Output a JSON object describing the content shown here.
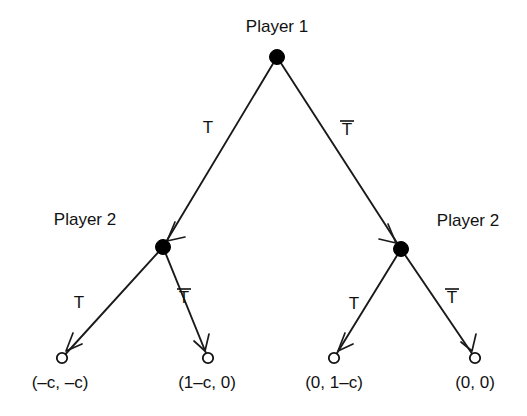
{
  "diagram": {
    "type": "extensive-form-game-tree",
    "title": "",
    "background_color": "#ffffff",
    "line_color": "#1a1a1a",
    "text_color": "#111111",
    "nodes": {
      "root": {
        "id": "root",
        "player_label": "Player 1",
        "kind": "decision",
        "x": 277,
        "y": 57
      },
      "left_player2": {
        "id": "left_player2",
        "player_label": "Player 2",
        "kind": "decision",
        "x": 163,
        "y": 247
      },
      "right_player2": {
        "id": "right_player2",
        "player_label": "Player 2",
        "kind": "decision",
        "x": 401,
        "y": 249
      }
    },
    "terminals": [
      {
        "id": "t1",
        "x": 62,
        "y": 358,
        "payoff": "(–c, –c)",
        "payoff_x": 60,
        "payoff_y": 388
      },
      {
        "id": "t2",
        "x": 208,
        "y": 358,
        "payoff": "(1–c, 0)",
        "payoff_x": 207,
        "payoff_y": 388
      },
      {
        "id": "t3",
        "x": 334,
        "y": 358,
        "payoff": "(0, 1–c)",
        "payoff_x": 334,
        "payoff_y": 388
      },
      {
        "id": "t4",
        "x": 475,
        "y": 358,
        "payoff": "(0, 0)",
        "payoff_x": 475,
        "payoff_y": 388
      }
    ],
    "edges": [
      {
        "id": "root-left",
        "from": "root",
        "to": "left_player2",
        "action_label": "T",
        "has_overbar": false,
        "label_x": 208,
        "label_y": 133
      },
      {
        "id": "root-right",
        "from": "root",
        "to": "right_player2",
        "action_label": "T",
        "has_overbar": true,
        "label_x": 347,
        "label_y": 135
      },
      {
        "id": "left-t1",
        "from": "left_player2",
        "to": "t1",
        "action_label": "T",
        "has_overbar": false,
        "label_x": 79,
        "label_y": 308
      },
      {
        "id": "left-t2",
        "from": "left_player2",
        "to": "t2",
        "action_label": "T",
        "has_overbar": true,
        "label_x": 184,
        "label_y": 303
      },
      {
        "id": "right-t3",
        "from": "right_player2",
        "to": "t3",
        "action_label": "T",
        "has_overbar": false,
        "label_x": 354,
        "label_y": 309
      },
      {
        "id": "right-t4",
        "from": "right_player2",
        "to": "t4",
        "action_label": "T",
        "has_overbar": true,
        "label_x": 452,
        "label_y": 303
      }
    ],
    "player_label_positions": {
      "root_label_x": 277,
      "root_label_y": 32,
      "left_label_x": 85,
      "left_label_y": 225,
      "right_label_x": 468,
      "right_label_y": 226
    }
  }
}
